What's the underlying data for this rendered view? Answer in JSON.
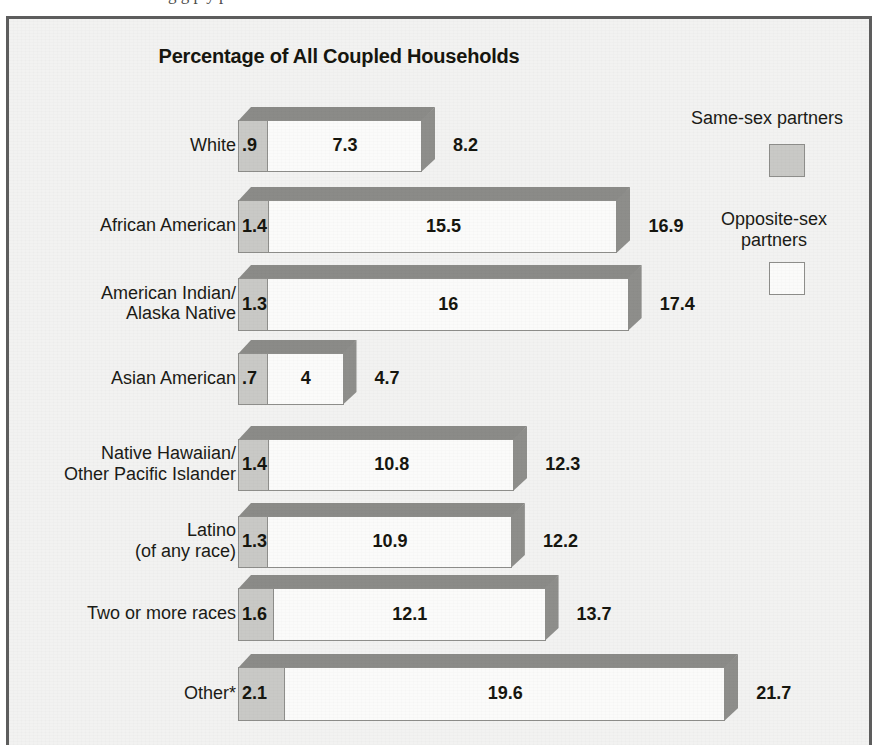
{
  "page": {
    "cut_off_top_text": "g g   p y   p"
  },
  "chart": {
    "title": "Percentage of All Coupled Households",
    "legend": [
      {
        "label": "Same-sex partners",
        "swatch": "gray-swatch",
        "color": "#c9c9c6"
      },
      {
        "label": "Opposite-sex\npartners",
        "swatch": "white-swatch",
        "color": "#fbfbfa"
      }
    ]
  },
  "chart_data": {
    "type": "bar",
    "orientation": "horizontal",
    "stacked": true,
    "title": "Percentage of All Coupled Households",
    "xlabel": "",
    "ylabel": "",
    "grid": false,
    "legend_position": "right",
    "categories": [
      "White",
      "African American",
      "American Indian/\nAlaska Native",
      "Asian American",
      "Native Hawaiian/\nOther Pacific Islander",
      "Latino\n(of any race)",
      "Two or more races",
      "Other*"
    ],
    "series": [
      {
        "name": "Same-sex partners",
        "values": [
          0.9,
          1.4,
          1.3,
          0.7,
          1.4,
          1.3,
          1.6,
          2.1
        ]
      },
      {
        "name": "Opposite-sex partners",
        "values": [
          7.3,
          15.5,
          16,
          4,
          10.8,
          10.9,
          12.1,
          19.6
        ]
      }
    ],
    "totals": [
      8.2,
      16.9,
      17.4,
      4.7,
      12.3,
      12.2,
      13.7,
      21.7
    ],
    "value_labels": {
      "same_sex": [
        ".9",
        "1.4",
        "1.3",
        ".7",
        "1.4",
        "1.3",
        "1.6",
        "2.1"
      ],
      "opposite_sex": [
        "7.3",
        "15.5",
        "16",
        "4",
        "10.8",
        "10.9",
        "12.1",
        "19.6"
      ],
      "total": [
        "8.2",
        "16.9",
        "17.4",
        "4.7",
        "12.3",
        "12.2",
        "13.7",
        "21.7"
      ]
    },
    "xlim": [
      0,
      21.7
    ]
  }
}
